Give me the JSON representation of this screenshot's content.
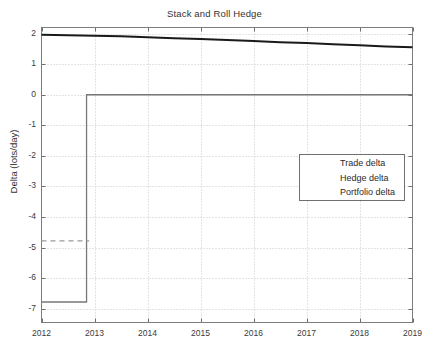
{
  "chart_data": {
    "type": "line",
    "title": "Stack and Roll Hedge",
    "xlabel": "",
    "ylabel": "Delta (lots/day)",
    "xlim": [
      2012,
      2019
    ],
    "ylim": [
      -7.45,
      2.2
    ],
    "xticks": [
      "2012",
      "2013",
      "2014",
      "2015",
      "2016",
      "2017",
      "2018",
      "2019"
    ],
    "xtick_values": [
      2012,
      2013,
      2014,
      2015,
      2016,
      2017,
      2018,
      2019
    ],
    "yticks": [
      "2",
      "1",
      "0",
      "-1",
      "-2",
      "-3",
      "-4",
      "-5",
      "-6",
      "-7"
    ],
    "ytick_values": [
      2,
      1,
      0,
      -1,
      -2,
      -3,
      -4,
      -5,
      -6,
      -7
    ],
    "grid": true,
    "legend_position": "center-right",
    "series": [
      {
        "name": "Trade delta",
        "color": "#1a1a1a",
        "style": "solid",
        "width": 2.0,
        "x": [
          2012.0,
          2012.5,
          2013.0,
          2013.5,
          2014.0,
          2014.5,
          2015.0,
          2015.5,
          2016.0,
          2016.5,
          2017.0,
          2017.5,
          2018.0,
          2018.5,
          2019.0
        ],
        "y": [
          1.96,
          1.95,
          1.93,
          1.91,
          1.88,
          1.85,
          1.82,
          1.79,
          1.76,
          1.72,
          1.69,
          1.65,
          1.62,
          1.58,
          1.55
        ]
      },
      {
        "name": "Hedge delta",
        "color": "#787878",
        "style": "solid",
        "width": 1.3,
        "x": [
          2012.0,
          2012.85,
          2012.85,
          2019.0
        ],
        "y": [
          -6.78,
          -6.78,
          0.0,
          0.0
        ]
      },
      {
        "name": "Portfolio delta",
        "color": "#9a9a9a",
        "style": "dashed",
        "width": 1.2,
        "x": [
          2012.0,
          2012.9
        ],
        "y": [
          -4.78,
          -4.78
        ]
      }
    ],
    "annotations": []
  },
  "legend": {
    "entries": [
      {
        "label": "Trade delta"
      },
      {
        "label": "Hedge delta"
      },
      {
        "label": "Portfolio delta"
      }
    ]
  },
  "axes": {
    "frame_color": "#7d7d7d",
    "grid_color": "#c8c8c8",
    "background": "#ffffff"
  }
}
